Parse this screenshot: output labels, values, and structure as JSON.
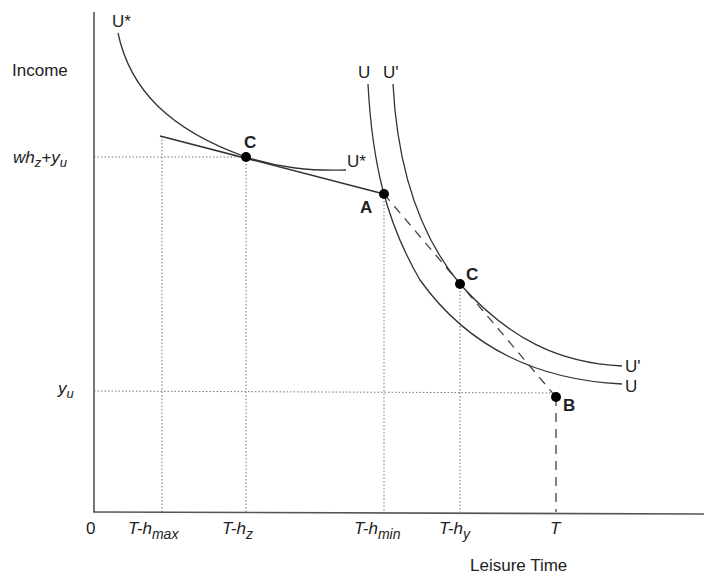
{
  "axes": {
    "y_label": "Income",
    "x_label": "Leisure Time",
    "origin_label": "0"
  },
  "y_ticks": [
    {
      "id": "whz_yu",
      "parts": [
        {
          "t": "wh",
          "sub": false
        },
        {
          "t": "z",
          "sub": true
        },
        {
          "t": "+y",
          "sub": false
        },
        {
          "t": "u",
          "sub": true
        }
      ]
    },
    {
      "id": "yu",
      "parts": [
        {
          "t": "y",
          "sub": false
        },
        {
          "t": "u",
          "sub": true
        }
      ]
    }
  ],
  "x_ticks": {
    "t_hmax": {
      "main": "T-h",
      "sub": "max"
    },
    "t_hz": {
      "main": "T-h",
      "sub": "z"
    },
    "t_hmin": {
      "main": "T-h",
      "sub": "min"
    },
    "t_hy": {
      "main": "T-h",
      "sub": "y"
    },
    "t": {
      "main": "T",
      "sub": ""
    }
  },
  "curves": {
    "u_star_top": "U*",
    "u_star_bottom": "U*",
    "u_top": "U",
    "u_prime_top": "U'",
    "u_prime_right": "U'",
    "u_right": "U"
  },
  "points": {
    "c_left": "C",
    "a": "A",
    "c_right": "C",
    "b": "B"
  }
}
